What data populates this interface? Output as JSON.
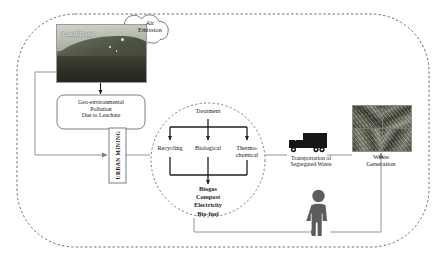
{
  "diagram": {
    "title_visible": false,
    "outer_boundary": {
      "style": "dashed-rounded-rect"
    }
  },
  "cloud": {
    "line1": "Air",
    "line2": "Emission",
    "name": "air-emission"
  },
  "landfill": {
    "caption": "Landfill site"
  },
  "pollution_box": {
    "line1": "Geo-environmental",
    "line2": "Pollution",
    "line3": "Due to Leachate"
  },
  "urban_mining": {
    "label": "URBAN MINING"
  },
  "treatment": {
    "root": "Treatment",
    "branches": [
      {
        "label": "Recycling"
      },
      {
        "label": "Biological"
      },
      {
        "label_line1": "Thermo-",
        "label_line2": "chemical"
      }
    ],
    "outputs": [
      "Biogas",
      "Compost",
      "Electricity",
      "Bio-fuel"
    ]
  },
  "transport": {
    "line1": "Transportation of",
    "line2": "Segregated Waste"
  },
  "waste_generation": {
    "line1": "Waste",
    "line2": "Generation"
  },
  "person": {
    "name": "citizen-figure"
  },
  "colors": {
    "boundary": "#6f6f6f",
    "arrow": "#7d7d7d",
    "tree_arrow": "#1f1f1f",
    "truck": "#1c1c1c",
    "person": "#5a5a5a",
    "text": "#1a1a1a"
  }
}
